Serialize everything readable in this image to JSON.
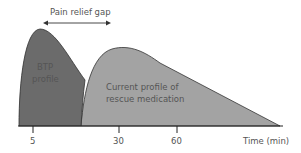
{
  "diagram": {
    "gap_label": "Pain relief gap",
    "btp_label_line1": "BTP",
    "btp_label_line2": "profile",
    "rescue_label_line1": "Current profile of",
    "rescue_label_line2": "rescue medication",
    "x_axis_label": "Time (min)",
    "ticks": [
      "5",
      "30",
      "60"
    ],
    "colors": {
      "btp_fill": "#6b6b6b",
      "rescue_fill": "#a3a3a3",
      "axis": "#222222",
      "text": "#555555"
    }
  }
}
